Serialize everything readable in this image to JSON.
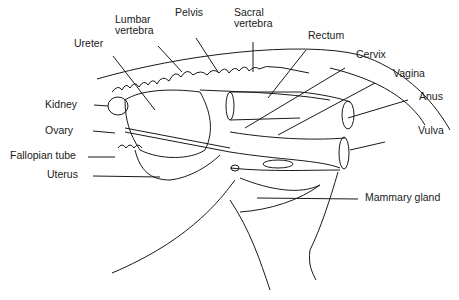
{
  "figure": {
    "labels": {
      "ureter": "Ureter",
      "lumbar_vertebra": "Lumbar\nvertebra",
      "pelvis": "Pelvis",
      "sacral_vertebra": "Sacral\nvertebra",
      "rectum": "Rectum",
      "cervix": "Cervix",
      "vagina": "Vagina",
      "anus": "Anus",
      "vulva": "Vulva",
      "kidney": "Kidney",
      "ovary": "Ovary",
      "fallopian_tube": "Fallopian tube",
      "uterus": "Uterus",
      "mammary_gland": "Mammary gland"
    }
  }
}
